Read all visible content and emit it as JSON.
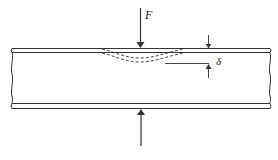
{
  "diagram": {
    "labels": {
      "force": "F",
      "deflection": "δ"
    },
    "colors": {
      "stroke": "#333333",
      "background": "#ffffff"
    },
    "elements": {
      "top_plate": {
        "x_start": 10,
        "x_end": 272,
        "y_outer": 48,
        "y_inner": 52
      },
      "bottom_plate": {
        "x_start": 10,
        "x_end": 272,
        "y_inner": 103,
        "y_outer": 108
      },
      "force_arrow_down": {
        "x": 140,
        "y_start": 8,
        "y_end": 48
      },
      "reaction_arrow_up": {
        "x": 141,
        "y_start": 146,
        "y_end": 109
      },
      "deflection_curves": {
        "x_start": 100,
        "x_end": 184,
        "max_depth": 62
      },
      "delta_dimension": {
        "x": 209,
        "top_y": 48,
        "bottom_y": 63,
        "ref_line_x_start": 165
      }
    }
  }
}
